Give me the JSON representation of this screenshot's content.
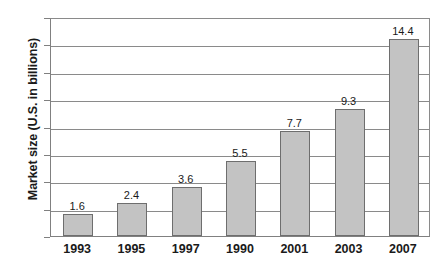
{
  "chart_data": {
    "type": "bar",
    "title": "",
    "subtitle": "",
    "xlabel": "",
    "ylabel": "Market size (U.S. in billions)",
    "categories": [
      "1993",
      "1995",
      "1997",
      "1990",
      "2001",
      "2003",
      "2007"
    ],
    "values": [
      1.6,
      2.4,
      3.6,
      5.5,
      7.7,
      9.3,
      14.4
    ],
    "value_labels": [
      "1.6",
      "2.4",
      "3.6",
      "5.5",
      "7.7",
      "9.3",
      "14.4"
    ],
    "series": [
      {
        "name": "Market size",
        "values": [
          1.6,
          2.4,
          3.6,
          5.5,
          7.7,
          9.3,
          14.4
        ]
      }
    ],
    "ylim": [
      0,
      16
    ],
    "ytick_values": [
      0,
      2,
      4,
      6,
      8,
      10,
      12,
      14,
      16
    ],
    "ytick_labels": [
      "0",
      "2",
      "4",
      "6",
      "8",
      "10",
      "12",
      "14",
      "16"
    ],
    "grid": true,
    "grid_axis": "y",
    "legend": false,
    "legend_position": "none",
    "annotations": [],
    "colors": {
      "bar_fill": "#c3c3c3",
      "bar_border": "#6e6e6e",
      "gridline": "#8a8a8a",
      "axis": "#808080",
      "text": "#1a1a1a",
      "background": "#ffffff"
    }
  }
}
